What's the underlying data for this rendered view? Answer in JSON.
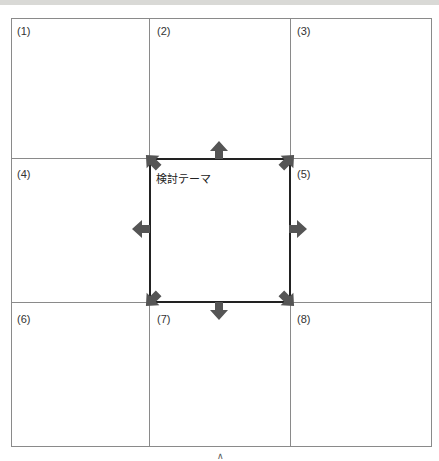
{
  "diagram": {
    "type": "nine-cell-grid",
    "cells": [
      {
        "id": 1,
        "label": "(1)"
      },
      {
        "id": 2,
        "label": "(2)"
      },
      {
        "id": 3,
        "label": "(3)"
      },
      {
        "id": 4,
        "label": "(4)"
      },
      {
        "id": 5,
        "label": "(5)"
      },
      {
        "id": 6,
        "label": "(6)"
      },
      {
        "id": 7,
        "label": "(7)"
      },
      {
        "id": 8,
        "label": "(8)"
      }
    ],
    "center": {
      "label": "検討テーマ"
    },
    "arrows": [
      "up-left",
      "up",
      "up-right",
      "left",
      "right",
      "down-left",
      "down",
      "down-right"
    ],
    "footer_mark": "∧",
    "colors": {
      "grid_line": "#8a8a8a",
      "box_line": "#222222",
      "arrow": "#555555"
    }
  }
}
